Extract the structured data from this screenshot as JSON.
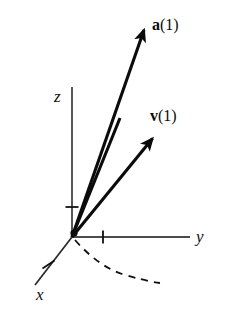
{
  "figure": {
    "background_color": "#ffffff",
    "ink_color": "#111111"
  },
  "axes": {
    "z": {
      "label": "z",
      "name": "z-axis",
      "from": [
        72,
        237
      ],
      "to": [
        72,
        87
      ],
      "tick": {
        "name": "z-axis-tick",
        "at": [
          72,
          207
        ],
        "length": 13,
        "orientation": "horizontal"
      }
    },
    "y": {
      "label": "y",
      "name": "y-axis",
      "from": [
        72,
        237
      ],
      "to": [
        190,
        237
      ],
      "tick": {
        "name": "y-axis-tick",
        "at": [
          103,
          237
        ],
        "length": 13,
        "orientation": "vertical"
      }
    },
    "x": {
      "label": "x",
      "name": "x-axis",
      "from": [
        72,
        237
      ],
      "to": [
        35,
        285
      ],
      "tick": {
        "name": "x-axis-tick",
        "at": [
          48,
          264
        ],
        "length": 13,
        "orientation": "perpendicular"
      }
    },
    "origin": [
      72,
      237
    ]
  },
  "vectors": [
    {
      "name": "acceleration-vector",
      "label_symbol": "a",
      "label_argument": "(1)",
      "label_full": "a(1)",
      "bold_symbol": true,
      "from": [
        72,
        237
      ],
      "to": [
        145,
        25
      ],
      "has_arrowhead": true,
      "line_width": 3.0,
      "color": "#0b0b0b"
    },
    {
      "name": "tangent-segment",
      "label_symbol": "",
      "label_argument": "",
      "label_full": "",
      "bold_symbol": false,
      "from": [
        72,
        237
      ],
      "to": [
        120,
        118
      ],
      "has_arrowhead": false,
      "line_width": 3.0,
      "color": "#0b0b0b"
    },
    {
      "name": "velocity-vector",
      "label_symbol": "v",
      "label_argument": "(1)",
      "label_full": "v(1)",
      "bold_symbol": true,
      "from": [
        72,
        237
      ],
      "to": [
        155,
        135
      ],
      "has_arrowhead": true,
      "line_width": 3.0,
      "color": "#0b0b0b"
    }
  ],
  "curve": {
    "name": "space-curve",
    "style": "dashed",
    "dash_pattern": "7 6",
    "line_width": 1.8,
    "color": "#111111",
    "path_points": [
      [
        75,
        240
      ],
      [
        92,
        258
      ],
      [
        115,
        271
      ],
      [
        140,
        279
      ],
      [
        160,
        283
      ]
    ]
  }
}
